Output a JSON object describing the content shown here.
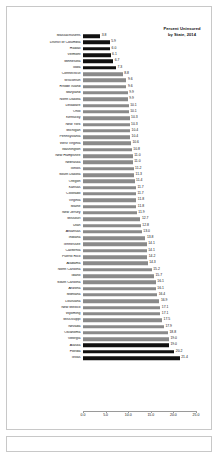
{
  "chart_data": {
    "type": "bar",
    "orientation": "horizontal",
    "title": "Percent Uninsured\nby State, 2014",
    "title_line1": "Percent Uninsured",
    "title_line2": "by State, 2014",
    "xlabel": "",
    "ylabel": "",
    "xlim": [
      0.0,
      25.0
    ],
    "grid": false,
    "legend": null,
    "tick_labels": [
      "0.0",
      "5.0",
      "10.0",
      "15.0",
      "20.0",
      "25.0"
    ],
    "tick_values": [
      0.0,
      5.0,
      10.0,
      15.0,
      20.0,
      25.0
    ],
    "highlight_color": "#111111",
    "bar_color": "#8a8a8a",
    "categories": [
      "Massachusetts",
      "District of Columbia",
      "Hawaii",
      "Vermont",
      "Minnesota",
      "Iowa",
      "Connecticut",
      "Wisconsin",
      "Rhode Island",
      "Maryland",
      "North Dakota",
      "Delaware",
      "Ohio",
      "Kentucky",
      "New York",
      "Michigan",
      "Pennsylvania",
      "West Virginia",
      "Washington",
      "New Hampshire",
      "Nebraska",
      "Illinois",
      "South Dakota",
      "Oregon",
      "Kansas",
      "Colorado",
      "Virginia",
      "Maine",
      "New Jersey",
      "Missouri",
      "Utah",
      "Arkansas",
      "Indiana",
      "Tennessee",
      "California",
      "Puerto Rico",
      "Alabama",
      "North Carolina",
      "Idaho",
      "South Carolina",
      "Arizona",
      "Montana",
      "Louisiana",
      "New Mexico",
      "Wyoming",
      "Mississippi",
      "Nevada",
      "Oklahoma",
      "Georgia",
      "Alaska",
      "Florida",
      "Texas"
    ],
    "values": [
      3.8,
      5.9,
      6.0,
      6.1,
      6.7,
      7.3,
      8.8,
      9.6,
      9.6,
      9.9,
      9.9,
      10.1,
      10.1,
      10.3,
      10.3,
      10.4,
      10.4,
      10.6,
      10.8,
      11.0,
      11.0,
      11.2,
      11.3,
      11.4,
      11.7,
      11.7,
      11.8,
      11.8,
      11.9,
      12.7,
      12.8,
      13.0,
      13.8,
      14.1,
      14.1,
      14.2,
      14.3,
      15.2,
      15.7,
      16.1,
      16.1,
      16.4,
      16.9,
      17.1,
      17.1,
      17.5,
      17.9,
      18.8,
      19.0,
      19.0,
      20.2,
      21.4
    ],
    "highlight_flags": [
      true,
      true,
      true,
      true,
      true,
      true,
      false,
      false,
      false,
      false,
      false,
      false,
      false,
      false,
      false,
      false,
      false,
      false,
      false,
      false,
      false,
      false,
      false,
      false,
      false,
      false,
      false,
      false,
      false,
      false,
      false,
      false,
      false,
      false,
      false,
      false,
      false,
      false,
      false,
      false,
      false,
      false,
      false,
      false,
      false,
      false,
      false,
      false,
      false,
      true,
      true,
      true
    ]
  }
}
